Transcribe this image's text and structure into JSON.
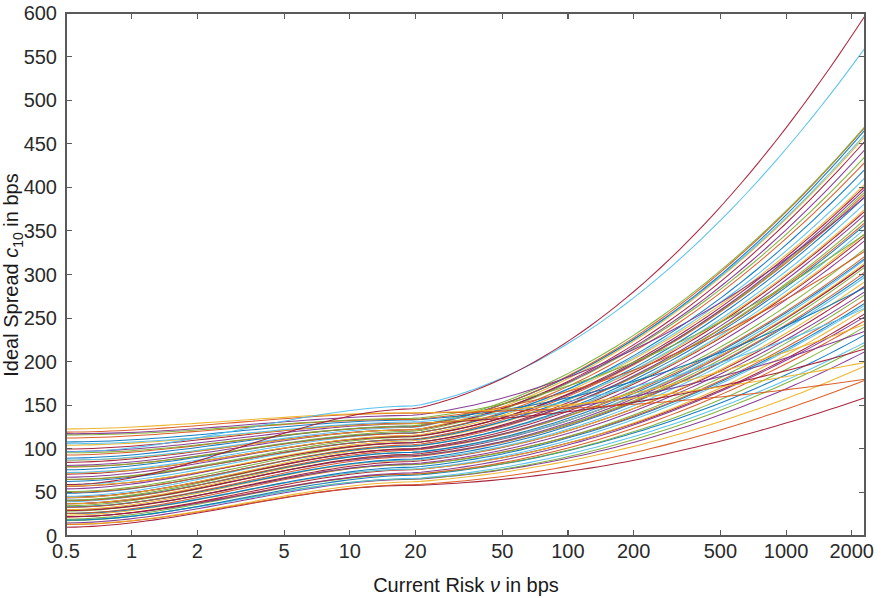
{
  "chart_data": {
    "type": "line",
    "title": "",
    "xlabel": "Current Risk ν in bps",
    "ylabel": "Ideal Spread c_10 in bps",
    "xlabel_parts": {
      "pre": "Current Risk ",
      "symbol": "ν",
      "post": " in bps"
    },
    "ylabel_parts": {
      "pre": "Ideal Spread ",
      "symbol": "c",
      "subscript": "10",
      "post": " in bps"
    },
    "xscale": "log",
    "yscale": "linear",
    "xlim": [
      0.5,
      2300
    ],
    "ylim": [
      0,
      600
    ],
    "grid": false,
    "legend": null,
    "legend_position": "none",
    "x_ticks": [
      0.5,
      1,
      2,
      5,
      10,
      20,
      50,
      100,
      200,
      500,
      1000,
      2000
    ],
    "x_tick_labels": [
      "0.5",
      "1",
      "2",
      "5",
      "10",
      "20",
      "50",
      "100",
      "200",
      "500",
      "1000",
      "2000"
    ],
    "y_ticks": [
      0,
      50,
      100,
      150,
      200,
      250,
      300,
      350,
      400,
      450,
      500,
      550,
      600
    ],
    "y_tick_labels": [
      "0",
      "50",
      "100",
      "150",
      "200",
      "250",
      "300",
      "350",
      "400",
      "450",
      "500",
      "550",
      "600"
    ],
    "series_count": 70,
    "palette": [
      "#0072BD",
      "#D95319",
      "#EDB120",
      "#7E2F8E",
      "#77AC30",
      "#4DBEEE",
      "#A2142F",
      "#8C564B",
      "#2CA02C",
      "#9467BD",
      "#E377C2",
      "#17BECF",
      "#BCBD22",
      "#FF7F0E",
      "#1F77B4",
      "#D62728"
    ],
    "series": [
      {
        "name": "curve-01",
        "y_start": 10,
        "y_mid": 58,
        "y_end": 158,
        "color": "#A2142F"
      },
      {
        "name": "curve-02",
        "y_start": 12,
        "y_mid": 60,
        "y_end": 178,
        "color": "#D95319"
      },
      {
        "name": "curve-03",
        "y_start": 14,
        "y_mid": 62,
        "y_end": 196,
        "color": "#EDB120"
      },
      {
        "name": "curve-04",
        "y_start": 16,
        "y_mid": 64,
        "y_end": 212,
        "color": "#7E2F8E"
      },
      {
        "name": "curve-05",
        "y_start": 17,
        "y_mid": 66,
        "y_end": 218,
        "color": "#77AC30"
      },
      {
        "name": "curve-06",
        "y_start": 18,
        "y_mid": 67,
        "y_end": 222,
        "color": "#4DBEEE"
      },
      {
        "name": "curve-07",
        "y_start": 19,
        "y_mid": 69,
        "y_end": 232,
        "color": "#0072BD"
      },
      {
        "name": "curve-08",
        "y_start": 20,
        "y_mid": 70,
        "y_end": 240,
        "color": "#77AC30"
      },
      {
        "name": "curve-09",
        "y_start": 21,
        "y_mid": 72,
        "y_end": 246,
        "color": "#D95319"
      },
      {
        "name": "curve-10",
        "y_start": 22,
        "y_mid": 73,
        "y_end": 252,
        "color": "#7E2F8E"
      },
      {
        "name": "curve-11",
        "y_start": 23,
        "y_mid": 75,
        "y_end": 256,
        "color": "#A2142F"
      },
      {
        "name": "curve-12",
        "y_start": 24,
        "y_mid": 76,
        "y_end": 260,
        "color": "#EDB120"
      },
      {
        "name": "curve-13",
        "y_start": 25,
        "y_mid": 78,
        "y_end": 264,
        "color": "#4DBEEE"
      },
      {
        "name": "curve-14",
        "y_start": 26,
        "y_mid": 79,
        "y_end": 268,
        "color": "#0072BD"
      },
      {
        "name": "curve-15",
        "y_start": 27,
        "y_mid": 81,
        "y_end": 272,
        "color": "#D95319"
      },
      {
        "name": "curve-16",
        "y_start": 28,
        "y_mid": 82,
        "y_end": 276,
        "color": "#77AC30"
      },
      {
        "name": "curve-17",
        "y_start": 29,
        "y_mid": 84,
        "y_end": 280,
        "color": "#7E2F8E"
      },
      {
        "name": "curve-18",
        "y_start": 30,
        "y_mid": 85,
        "y_end": 288,
        "color": "#A2142F"
      },
      {
        "name": "curve-19",
        "y_start": 31,
        "y_mid": 86,
        "y_end": 292,
        "color": "#EDB120"
      },
      {
        "name": "curve-20",
        "y_start": 32,
        "y_mid": 88,
        "y_end": 296,
        "color": "#4DBEEE"
      },
      {
        "name": "curve-21",
        "y_start": 33,
        "y_mid": 89,
        "y_end": 300,
        "color": "#0072BD"
      },
      {
        "name": "curve-22",
        "y_start": 34,
        "y_mid": 90,
        "y_end": 304,
        "color": "#D95319"
      },
      {
        "name": "curve-23",
        "y_start": 35,
        "y_mid": 92,
        "y_end": 308,
        "color": "#77AC30"
      },
      {
        "name": "curve-24",
        "y_start": 36,
        "y_mid": 93,
        "y_end": 310,
        "color": "#7E2F8E"
      },
      {
        "name": "curve-25",
        "y_start": 37,
        "y_mid": 94,
        "y_end": 312,
        "color": "#A2142F"
      },
      {
        "name": "curve-26",
        "y_start": 38,
        "y_mid": 95,
        "y_end": 314,
        "color": "#EDB120"
      },
      {
        "name": "curve-27",
        "y_start": 39,
        "y_mid": 96,
        "y_end": 316,
        "color": "#4DBEEE"
      },
      {
        "name": "curve-28",
        "y_start": 40,
        "y_mid": 97,
        "y_end": 318,
        "color": "#0072BD"
      },
      {
        "name": "curve-29",
        "y_start": 41,
        "y_mid": 98,
        "y_end": 322,
        "color": "#D95319"
      },
      {
        "name": "curve-30",
        "y_start": 42,
        "y_mid": 99,
        "y_end": 330,
        "color": "#77AC30"
      },
      {
        "name": "curve-31",
        "y_start": 43,
        "y_mid": 100,
        "y_end": 338,
        "color": "#7E2F8E"
      },
      {
        "name": "curve-32",
        "y_start": 44,
        "y_mid": 101,
        "y_end": 344,
        "color": "#A2142F"
      },
      {
        "name": "curve-33",
        "y_start": 45,
        "y_mid": 102,
        "y_end": 348,
        "color": "#EDB120"
      },
      {
        "name": "curve-34",
        "y_start": 46,
        "y_mid": 103,
        "y_end": 352,
        "color": "#4DBEEE"
      },
      {
        "name": "curve-35",
        "y_start": 48,
        "y_mid": 104,
        "y_end": 356,
        "color": "#0072BD"
      },
      {
        "name": "curve-36",
        "y_start": 50,
        "y_mid": 105,
        "y_end": 360,
        "color": "#D95319"
      },
      {
        "name": "curve-37",
        "y_start": 52,
        "y_mid": 106,
        "y_end": 364,
        "color": "#77AC30"
      },
      {
        "name": "curve-38",
        "y_start": 54,
        "y_mid": 107,
        "y_end": 368,
        "color": "#7E2F8E"
      },
      {
        "name": "curve-39",
        "y_start": 56,
        "y_mid": 108,
        "y_end": 372,
        "color": "#A2142F"
      },
      {
        "name": "curve-40",
        "y_start": 58,
        "y_mid": 109,
        "y_end": 376,
        "color": "#EDB120"
      },
      {
        "name": "curve-41",
        "y_start": 60,
        "y_mid": 110,
        "y_end": 382,
        "color": "#4DBEEE"
      },
      {
        "name": "curve-42",
        "y_start": 62,
        "y_mid": 111,
        "y_end": 388,
        "color": "#0072BD"
      },
      {
        "name": "curve-43",
        "y_start": 64,
        "y_mid": 112,
        "y_end": 392,
        "color": "#D95319"
      },
      {
        "name": "curve-44",
        "y_start": 66,
        "y_mid": 113,
        "y_end": 396,
        "color": "#77AC30"
      },
      {
        "name": "curve-45",
        "y_start": 68,
        "y_mid": 114,
        "y_end": 398,
        "color": "#7E2F8E"
      },
      {
        "name": "curve-46",
        "y_start": 70,
        "y_mid": 115,
        "y_end": 400,
        "color": "#A2142F"
      },
      {
        "name": "curve-47",
        "y_start": 72,
        "y_mid": 116,
        "y_end": 404,
        "color": "#EDB120"
      },
      {
        "name": "curve-48",
        "y_start": 74,
        "y_mid": 117,
        "y_end": 412,
        "color": "#4DBEEE"
      },
      {
        "name": "curve-49",
        "y_start": 76,
        "y_mid": 118,
        "y_end": 420,
        "color": "#0072BD"
      },
      {
        "name": "curve-50",
        "y_start": 78,
        "y_mid": 119,
        "y_end": 428,
        "color": "#D95319"
      },
      {
        "name": "curve-51",
        "y_start": 80,
        "y_mid": 120,
        "y_end": 436,
        "color": "#77AC30"
      },
      {
        "name": "curve-52",
        "y_start": 82,
        "y_mid": 121,
        "y_end": 444,
        "color": "#7E2F8E"
      },
      {
        "name": "curve-53",
        "y_start": 84,
        "y_mid": 122,
        "y_end": 452,
        "color": "#A2142F"
      },
      {
        "name": "curve-54",
        "y_start": 86,
        "y_mid": 123,
        "y_end": 458,
        "color": "#EDB120"
      },
      {
        "name": "curve-55",
        "y_start": 88,
        "y_mid": 124,
        "y_end": 462,
        "color": "#4DBEEE"
      },
      {
        "name": "curve-56",
        "y_start": 90,
        "y_mid": 125,
        "y_end": 466,
        "color": "#0072BD"
      },
      {
        "name": "curve-57",
        "y_start": 92,
        "y_mid": 126,
        "y_end": 468,
        "color": "#D95319"
      },
      {
        "name": "curve-58",
        "y_start": 95,
        "y_mid": 127,
        "y_end": 470,
        "color": "#77AC30"
      },
      {
        "name": "curve-59",
        "y_start": 98,
        "y_mid": 128,
        "y_end": 236,
        "color": "#7E2F8E"
      },
      {
        "name": "curve-60",
        "y_start": 100,
        "y_mid": 129,
        "y_end": 214,
        "color": "#A2142F"
      },
      {
        "name": "curve-61",
        "y_start": 103,
        "y_mid": 130,
        "y_end": 242,
        "color": "#EDB120"
      },
      {
        "name": "curve-62",
        "y_start": 106,
        "y_mid": 131,
        "y_end": 262,
        "color": "#4DBEEE"
      },
      {
        "name": "curve-63",
        "y_start": 109,
        "y_mid": 132,
        "y_end": 286,
        "color": "#0072BD"
      },
      {
        "name": "curve-64",
        "y_start": 112,
        "y_mid": 134,
        "y_end": 326,
        "color": "#D95319"
      },
      {
        "name": "curve-65",
        "y_start": 115,
        "y_mid": 136,
        "y_end": 346,
        "color": "#77AC30"
      },
      {
        "name": "curve-66",
        "y_start": 118,
        "y_mid": 138,
        "y_end": 390,
        "color": "#7E2F8E"
      },
      {
        "name": "curve-67",
        "y_start": 120,
        "y_mid": 140,
        "y_end": 180,
        "color": "#D95319"
      },
      {
        "name": "curve-68",
        "y_start": 122,
        "y_mid": 142,
        "y_end": 198,
        "color": "#EDB120"
      },
      {
        "name": "curve-69",
        "y_start": 96,
        "y_mid": 150,
        "y_end": 560,
        "color": "#4DBEEE"
      },
      {
        "name": "curve-70",
        "y_start": 60,
        "y_mid": 145,
        "y_end": 598,
        "color": "#A2142F"
      }
    ]
  },
  "figure": {
    "background_color": "#ffffff",
    "axis_color": "#5a5a5a",
    "text_color": "#1a1a1a"
  }
}
